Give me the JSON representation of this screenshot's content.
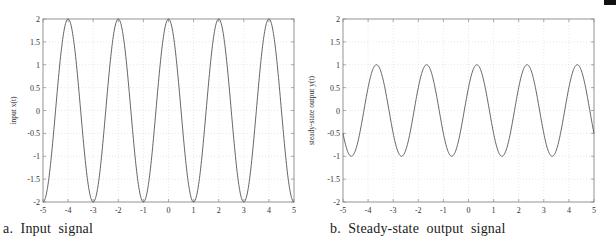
{
  "chart_data": [
    {
      "type": "line",
      "panel_id": "a",
      "caption": "a.  Input  signal",
      "title": "",
      "xlabel": "time, t",
      "ylabel": "input x(t)",
      "xlim": [
        -5,
        5
      ],
      "ylim": [
        -2,
        2
      ],
      "xticks": [
        -5,
        -4,
        -3,
        -2,
        -1,
        0,
        1,
        2,
        3,
        4,
        5
      ],
      "xtick_labels": [
        "-5",
        "-4",
        "-3",
        "-2",
        "-1",
        "0",
        "1",
        "2",
        "3",
        "4",
        "5"
      ],
      "yticks": [
        -2,
        -1.5,
        -1,
        -0.5,
        0,
        0.5,
        1,
        1.5,
        2
      ],
      "ytick_labels": [
        "-2",
        "-1.5",
        "-1",
        "-0.5",
        "0",
        "0.5",
        "1",
        "1.5",
        "2"
      ],
      "grid": true,
      "series": [
        {
          "name": "x(t)",
          "function": "2*cos(pi*t)",
          "amplitude": 2,
          "period": 2,
          "phase_shift_t": 0,
          "peaks_t": [
            -4,
            -2,
            0,
            2,
            4
          ],
          "troughs_t": [
            -5,
            -3,
            -1,
            1,
            3,
            5
          ],
          "x": [
            -5,
            -4.5,
            -4,
            -3.5,
            -3,
            -2.5,
            -2,
            -1.5,
            -1,
            -0.5,
            0,
            0.5,
            1,
            1.5,
            2,
            2.5,
            3,
            3.5,
            4,
            4.5,
            5
          ],
          "values": [
            -2,
            0,
            2,
            0,
            -2,
            0,
            2,
            0,
            -2,
            0,
            2,
            0,
            -2,
            0,
            2,
            0,
            -2,
            0,
            2,
            0,
            -2
          ]
        }
      ]
    },
    {
      "type": "line",
      "panel_id": "b",
      "caption": "b.  Steady-state  output  signal",
      "title": "",
      "xlabel": "time, t",
      "ylabel": "steady-state output y(t)",
      "xlim": [
        -5,
        5
      ],
      "ylim": [
        -2,
        2
      ],
      "xticks": [
        -5,
        -4,
        -3,
        -2,
        -1,
        0,
        1,
        2,
        3,
        4,
        5
      ],
      "xtick_labels": [
        "-5",
        "-4",
        "-3",
        "-2",
        "-1",
        "0",
        "1",
        "2",
        "3",
        "4",
        "5"
      ],
      "yticks": [
        -2,
        -1.5,
        -1,
        -0.5,
        0,
        0.5,
        1,
        1.5,
        2
      ],
      "ytick_labels": [
        "-2",
        "-1.5",
        "-1",
        "-0.5",
        "0",
        "0.5",
        "1",
        "1.5",
        "2"
      ],
      "grid": true,
      "series": [
        {
          "name": "y(t)",
          "function": "cos(pi*(t - 1/3))",
          "amplitude": 1,
          "period": 2,
          "phase_shift_t": 0.333,
          "peaks_t": [
            -3.667,
            -1.667,
            0.333,
            2.333,
            4.333
          ],
          "troughs_t": [
            -4.667,
            -2.667,
            -0.667,
            1.333,
            3.333
          ],
          "x": [
            -5,
            -4.667,
            -4,
            -3.667,
            -3,
            -2.667,
            -2,
            -1.667,
            -1,
            -0.667,
            0,
            0.333,
            1,
            1.333,
            2,
            2.333,
            3,
            3.333,
            4,
            4.333,
            5
          ],
          "values": [
            -0.5,
            -1,
            0.5,
            1,
            -0.5,
            -1,
            0.5,
            1,
            -0.5,
            -1,
            0.5,
            1,
            -0.5,
            -1,
            0.5,
            1,
            -0.5,
            -1,
            0.5,
            1,
            -0.5
          ]
        }
      ]
    }
  ],
  "colors": {
    "curve": "#555555",
    "axes": "#888888",
    "grid": "#d6d6d6",
    "corner_box": "#111111"
  }
}
